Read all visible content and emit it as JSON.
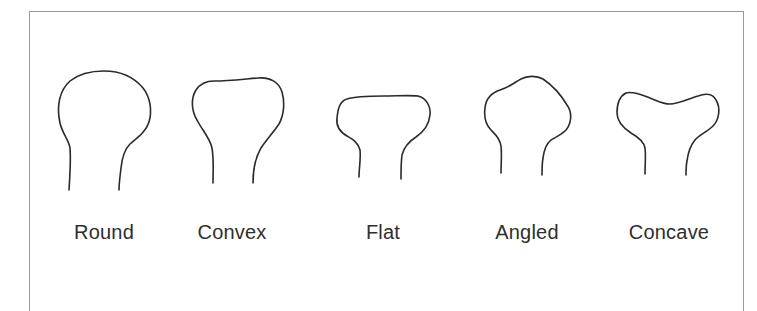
{
  "figure": {
    "title": "",
    "stroke_color": "#2a2a2a",
    "frame_color": "#9a9a9a",
    "shapes": [
      {
        "label": "Round",
        "center_x": 104
      },
      {
        "label": "Convex",
        "center_x": 232
      },
      {
        "label": "Flat",
        "center_x": 383
      },
      {
        "label": "Angled",
        "center_x": 527
      },
      {
        "label": "Concave",
        "center_x": 669
      }
    ]
  }
}
